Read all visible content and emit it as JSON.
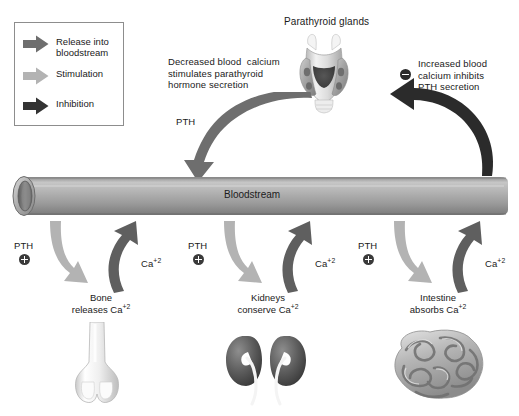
{
  "figure": {
    "background": "#ffffff"
  },
  "legend": {
    "items": [
      {
        "label": "Release into\nbloodstream",
        "icon": "right-arrow-icon",
        "color": "#6e6e6e"
      },
      {
        "label": "Stimulation",
        "icon": "right-arrow-icon",
        "color": "#b3b3b3"
      },
      {
        "label": "Inhibition",
        "icon": "right-arrow-icon",
        "color": "#333333"
      }
    ]
  },
  "annotations": {
    "decreased": "Decreased blood  calcium\nstimulates parathyroid\nhormone secretion",
    "increased": "Increased blood\ncalcium inhibits\nPTH secretion",
    "gland_title": "Parathyroid glands",
    "pth_arrow_label": "PTH"
  },
  "bloodstream": {
    "label": "Bloodstream",
    "color": "#9a9a9a"
  },
  "targets": [
    {
      "id": "bone",
      "stimulus_label": "PTH",
      "stimulus_sign": "plus",
      "return_label_base": "Ca",
      "return_label_sup": "+2",
      "organ_label_line1": "Bone",
      "organ_label_line2_base": "releases Ca",
      "organ_label_line2_sup": "+2",
      "organ_icon": "femur-bone-icon"
    },
    {
      "id": "kidneys",
      "stimulus_label": "PTH",
      "stimulus_sign": "plus",
      "return_label_base": "Ca",
      "return_label_sup": "+2",
      "organ_label_line1": "Kidneys",
      "organ_label_line2_base": "conserve Ca",
      "organ_label_line2_sup": "+2",
      "organ_icon": "kidneys-icon"
    },
    {
      "id": "intestine",
      "stimulus_label": "PTH",
      "stimulus_sign": "plus",
      "return_label_base": "Ca",
      "return_label_sup": "+2",
      "organ_label_line1": "Intestine",
      "organ_label_line2_base": "absorbs Ca",
      "organ_label_line2_sup": "+2",
      "organ_icon": "intestine-icon"
    }
  ],
  "colors": {
    "release_arrow": "#6e6e6e",
    "stimulation_arrow": "#b3b3b3",
    "inhibition_arrow": "#2b2b2b",
    "return_arrow": "#5f5f5f",
    "tube_gray": "#9a9a9a",
    "text": "#1a1a1a"
  }
}
